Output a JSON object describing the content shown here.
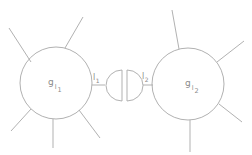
{
  "diagram": {
    "type": "feynman-style vertex gluing diagram",
    "stroke_color": "#a8a8a8",
    "label_color": "#8a8a8a",
    "vertices": [
      {
        "id": "left",
        "label_base": "g",
        "label_sub": "l",
        "label_subsub": "1",
        "center": [
          56,
          83
        ],
        "radius": 36,
        "spokes": [
          [
            [
              31,
              62
            ],
            [
              9,
              28
            ]
          ],
          [
            [
              65,
              50
            ],
            [
              83,
              17
            ]
          ],
          [
            [
              31,
              111
            ],
            [
              11,
              131
            ]
          ],
          [
            [
              53,
              120
            ],
            [
              53,
              148
            ]
          ],
          [
            [
              79,
              112
            ],
            [
              100,
              138
            ]
          ]
        ]
      },
      {
        "id": "right",
        "label_base": "g",
        "label_sub": "l",
        "label_subsub": "2",
        "center": [
          188,
          83
        ],
        "radius": 36,
        "spokes": [
          [
            [
              179,
              47
            ],
            [
              172,
              10
            ]
          ],
          [
            [
              217,
              61
            ],
            [
              244,
              41
            ]
          ],
          [
            [
              219,
              105
            ],
            [
              242,
              122
            ]
          ],
          [
            [
              190,
              120
            ],
            [
              190,
              152
            ]
          ]
        ]
      }
    ],
    "connectors": [
      {
        "id": "l1",
        "label_base": "l",
        "label_sub": "1",
        "from": [
          91,
          85
        ],
        "to": [
          105,
          85
        ]
      },
      {
        "id": "l2",
        "label_base": "l",
        "label_sub": "2",
        "from": [
          143,
          85
        ],
        "to": [
          153,
          85
        ]
      }
    ],
    "cut": {
      "left_half": {
        "flat_x": 122,
        "y_top": 70,
        "y_bottom": 101
      },
      "right_half": {
        "flat_x": 127,
        "y_top": 70,
        "y_bottom": 101
      }
    }
  }
}
